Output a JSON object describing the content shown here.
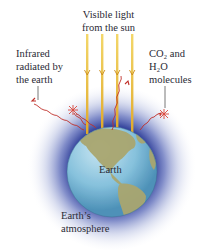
{
  "diagram": {
    "labels": {
      "visible_light": [
        "Visible light",
        "from the sun"
      ],
      "infrared": [
        "Infrared",
        "radiated by",
        "the earth"
      ],
      "molecules": [
        "CO₂ and",
        "H₂O",
        "molecules"
      ],
      "earth": "Earth",
      "atmosphere": [
        "Earth’s",
        "atmosphere"
      ]
    },
    "elements": {
      "sun_rays": {
        "count": 4,
        "color": "#e8b92e"
      },
      "infrared_rays": {
        "color": "#c0302a"
      },
      "molecules": {
        "count": 3,
        "color": "#d9463a"
      },
      "globe": {
        "ocean_color": "#7ab8d8",
        "land_color": "#a8a570"
      },
      "atmosphere": {
        "color": "#5b6fb8"
      }
    }
  }
}
